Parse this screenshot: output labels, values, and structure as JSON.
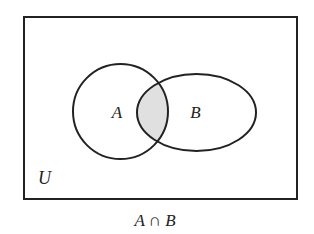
{
  "diagram": {
    "type": "venn",
    "universe": {
      "label": "U",
      "rect": {
        "x": 24,
        "y": 17,
        "width": 273,
        "height": 182
      }
    },
    "sets": [
      {
        "label": "A",
        "cx": 120.5,
        "cy": 111.5,
        "rx": 47.5,
        "ry": 47.5
      },
      {
        "label": "B",
        "cx": 196.5,
        "cy": 112.5,
        "rx": 59.5,
        "ry": 38.5
      }
    ],
    "shaded_region": "intersection",
    "caption": "A ∩ B",
    "caption_parts": {
      "left": "A",
      "operator": "∩",
      "right": "B"
    },
    "colors": {
      "stroke": "#222222",
      "shade": "#e0e0e0",
      "background": "#ffffff"
    }
  }
}
